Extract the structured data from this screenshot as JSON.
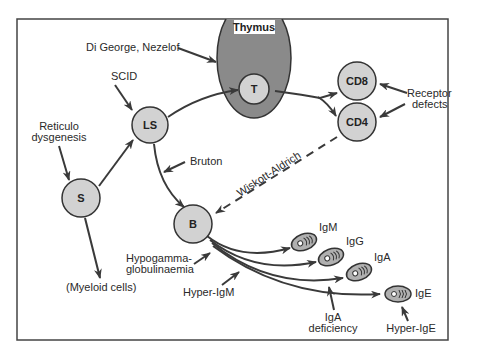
{
  "diagram": {
    "type": "immune-cell-differentiation-defects",
    "organ": {
      "label": "Thymus",
      "fill": "#8a8a8a"
    },
    "nodes": {
      "S": "S",
      "LS": "LS",
      "T": "T",
      "B": "B",
      "CD8": "CD8",
      "CD4": "CD4"
    },
    "plasma_cells": {
      "igm": "IgM",
      "igg": "IgG",
      "iga": "IgA",
      "ige": "IgE"
    },
    "defects": {
      "digeorge": "Di George, Nezelof",
      "scid": "SCID",
      "reticulo_1": "Reticulo",
      "reticulo_2": "dysgenesis",
      "bruton": "Bruton",
      "wiskott": "Wiskott-Aldrich",
      "receptor_1": "Receptor",
      "receptor_2": "defects",
      "hypogamma_1": "Hypogamma-",
      "hypogamma_2": "globulinaemia",
      "hyper_igm": "Hyper-IgM",
      "iga_def_1": "IgA",
      "iga_def_2": "deficiency",
      "hyper_ige": "Hyper-IgE"
    },
    "other": {
      "myeloid": "(Myeloid cells)"
    },
    "colors": {
      "node_fill": "#d2d2d2",
      "stroke": "#333333",
      "thymus_fill": "#8a8a8a"
    }
  }
}
